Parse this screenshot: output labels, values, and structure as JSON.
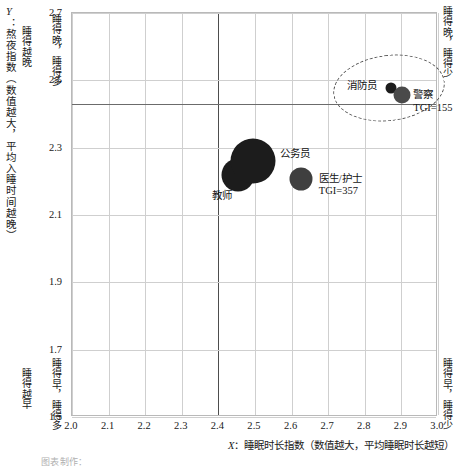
{
  "chart_data": {
    "type": "scatter",
    "title": "",
    "xlabel": "X：睡眠时长指数（数值越大，平均睡眠时长越短）",
    "ylabel": "Y：熬夜指数（数值越大，平均入睡时间越晚）",
    "xlim": [
      2.0,
      3.0
    ],
    "ylim": [
      1.5,
      2.7
    ],
    "xticks": [
      "2.0",
      "2.1",
      "2.2",
      "2.3",
      "2.4",
      "2.5",
      "2.6",
      "2.7",
      "2.8",
      "2.9",
      "3.0"
    ],
    "yticks": [
      "2.7",
      "2.5",
      "2.3",
      "2.1",
      "1.9",
      "1.7",
      "1.5"
    ],
    "grid": true,
    "legend": "none",
    "reference_lines": {
      "x": 2.4,
      "y": 2.43
    },
    "points": [
      {
        "name": "教师",
        "label": "教师",
        "tgi": "",
        "x": 2.455,
        "y": 2.215,
        "size": 33,
        "color": "#1c1c1c"
      },
      {
        "name": "公务员",
        "label": "公务员",
        "tgi": "",
        "x": 2.498,
        "y": 2.258,
        "size": 45,
        "color": "#1c1c1c"
      },
      {
        "name": "医生/护士",
        "label": "医生/护士",
        "tgi": "TGI=357",
        "x": 2.628,
        "y": 2.205,
        "size": 23,
        "color": "#3f3f3f"
      },
      {
        "name": "消防员",
        "label": "消防员",
        "tgi": "",
        "x": 2.875,
        "y": 2.475,
        "size": 11,
        "color": "#1c1c1c"
      },
      {
        "name": "警察",
        "label": "警察",
        "tgi": "TGI=155",
        "x": 2.905,
        "y": 2.452,
        "size": 17,
        "color": "#4a4a4a"
      }
    ],
    "annotations": {
      "quadrant_top_left": "睡得晚，睡得多",
      "quadrant_bottom_left": "睡得早，睡得多",
      "quadrant_top_right": "睡得晚，睡得少",
      "quadrant_bottom_right": "睡得早，睡得少",
      "y_axis_high": "睡得越晚",
      "y_axis_low": "睡得越早",
      "highlight_group": "消防员 / 警察"
    }
  },
  "axes": {
    "x_title_prefix": "X",
    "x_title_text": "：睡眠时长指数（数值越大，平均睡眠时长越短）",
    "y_title_prefix": "Y",
    "y_title_text": "：熬夜指数（数值越大，平均入睡时间越晚）"
  },
  "footer": {
    "credit": "图表制作："
  }
}
